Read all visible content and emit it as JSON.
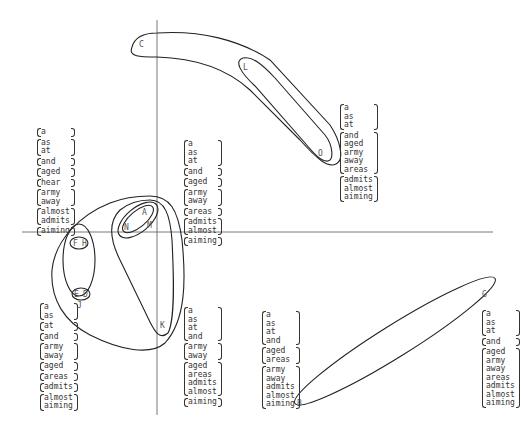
{
  "points": {
    "C": "C",
    "L": "L",
    "O": "O",
    "A": "A",
    "N": "N",
    "M": "M",
    "F": "F",
    "H": "H",
    "E": "E",
    "D": "D",
    "J": "J",
    "K": "K",
    "B": "B",
    "G": "G"
  },
  "word_groups": {
    "upper_left": [
      [
        "a"
      ],
      [
        "as",
        "at"
      ],
      [
        "and"
      ],
      [
        "aged"
      ],
      [
        "hear"
      ],
      [
        "army",
        "away"
      ],
      [
        "almost",
        "admits"
      ],
      [
        "aiming"
      ]
    ],
    "upper_center": [
      [
        "a",
        "as",
        "at"
      ],
      [
        "and"
      ],
      [
        "aged"
      ],
      [
        "army",
        "away"
      ],
      [
        "areas"
      ],
      [
        "admits",
        "almost"
      ],
      [
        "aiming"
      ]
    ],
    "upper_right": [
      [
        "a",
        "as",
        "at"
      ],
      [
        "and",
        "aged",
        "army",
        "away",
        "areas"
      ],
      [
        "admits",
        "almost",
        "aiming"
      ]
    ],
    "lower_left": [
      [
        "a",
        "as"
      ],
      [
        "at"
      ],
      [
        "and"
      ],
      [
        "army",
        "away"
      ],
      [
        "aged"
      ],
      [
        "areas"
      ],
      [
        "admits"
      ],
      [
        "almost",
        "aiming"
      ]
    ],
    "lower_center": [
      [
        "a",
        "as",
        "at",
        "and"
      ],
      [
        "army",
        "away"
      ],
      [
        "aged",
        "areas",
        "admits",
        "almost"
      ],
      [
        "aiming"
      ]
    ],
    "lower_mid": [
      [
        "a",
        "as",
        "at",
        "and"
      ],
      [
        "aged",
        "areas"
      ],
      [
        "army",
        "away",
        "admits",
        "almost",
        "aiming"
      ]
    ],
    "lower_right": [
      [
        "a",
        "as",
        "at"
      ],
      [
        "and"
      ],
      [
        "aged",
        "army",
        "away",
        "areas",
        "admits",
        "almost",
        "aiming"
      ]
    ]
  }
}
